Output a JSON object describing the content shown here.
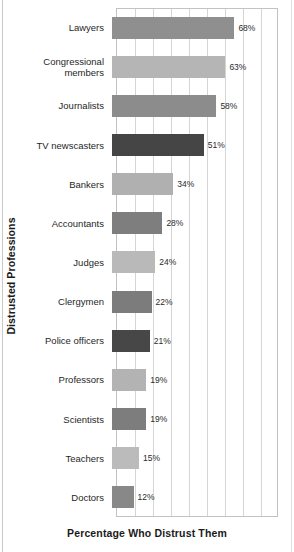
{
  "chart_data": {
    "type": "bar",
    "orientation": "horizontal",
    "title": "",
    "xlabel": "Percentage Who Distrust Them",
    "ylabel": "Distrusted Professions",
    "xlim": [
      0,
      90
    ],
    "grid": true,
    "gridline_step": 10,
    "legend": "none",
    "value_suffix": "%",
    "categories": [
      "Lawyers",
      "Congressional\nmembers",
      "Journalists",
      "TV newscasters",
      "Bankers",
      "Accountants",
      "Judges",
      "Clergymen",
      "Police officers",
      "Professors",
      "Scientists",
      "Teachers",
      "Doctors"
    ],
    "values": [
      68,
      63,
      58,
      51,
      34,
      28,
      24,
      22,
      21,
      19,
      19,
      15,
      12
    ],
    "value_labels": [
      "68%",
      "63%",
      "58%",
      "51%",
      "34%",
      "28%",
      "24%",
      "22%",
      "21%",
      "19%",
      "19%",
      "15%",
      "12%"
    ],
    "bar_colors": [
      "#8f8f8f",
      "#b5b5b5",
      "#8c8c8c",
      "#454545",
      "#b0b0b0",
      "#7e7e7e",
      "#b9b9b9",
      "#7c7c7c",
      "#474747",
      "#b3b3b3",
      "#7d7d7d",
      "#bbbbbb",
      "#888888"
    ]
  },
  "colors": {
    "background": "#ffffff",
    "plot_border": "#c2c2c2",
    "gridline": "#d5d5d5",
    "text": "#1f1f1f",
    "axis_title": "#1a1a1a"
  }
}
